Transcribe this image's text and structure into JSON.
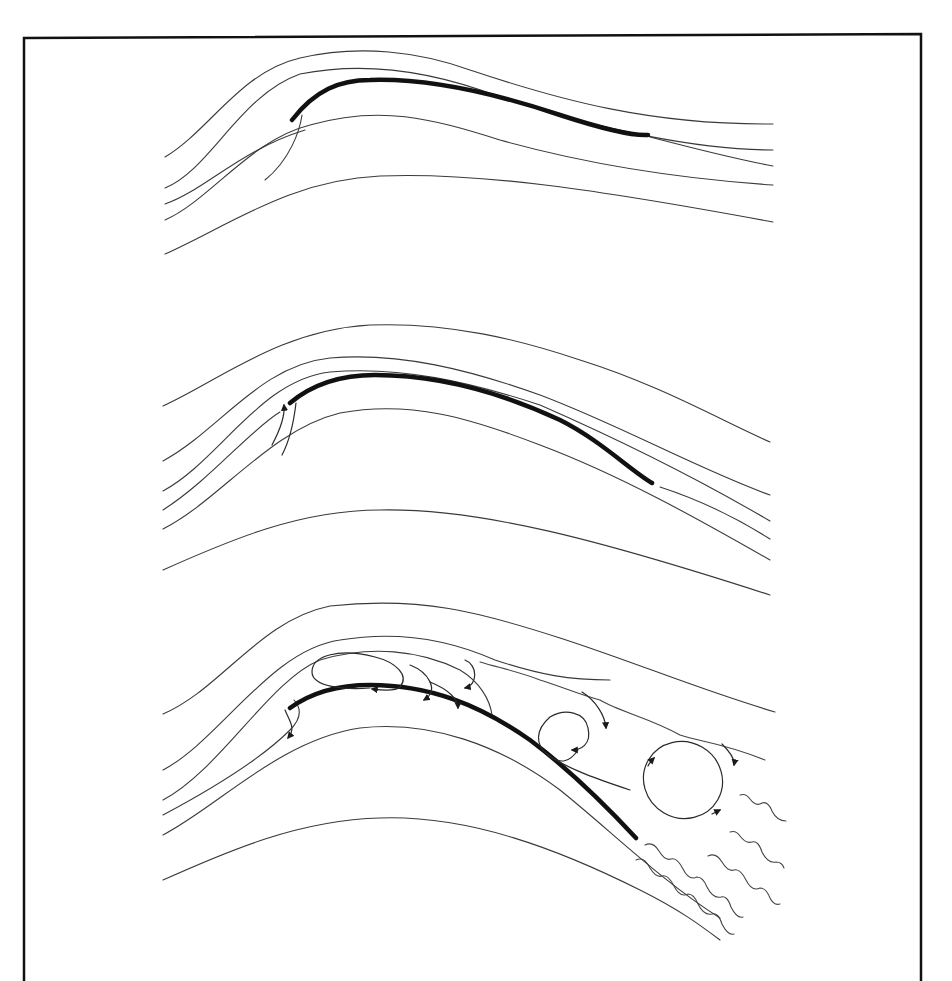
{
  "figure": {
    "colors": {
      "background": "#ffffff",
      "line": "#3a3a3a",
      "airfoil": "#111111",
      "frame": "#111111"
    },
    "panels": [
      {
        "id": "attached-flow",
        "streamline_count": 5,
        "features": [
          "attached streamlines",
          "airfoil"
        ]
      },
      {
        "id": "leading-edge-bubble",
        "streamline_count": 6,
        "features": [
          "attached streamlines",
          "airfoil",
          "leading-edge recirculation arrows"
        ]
      },
      {
        "id": "stalled-flow",
        "streamline_count": 6,
        "features": [
          "separated flow",
          "airfoil",
          "recirculation vortices",
          "turbulent wake"
        ]
      }
    ]
  }
}
